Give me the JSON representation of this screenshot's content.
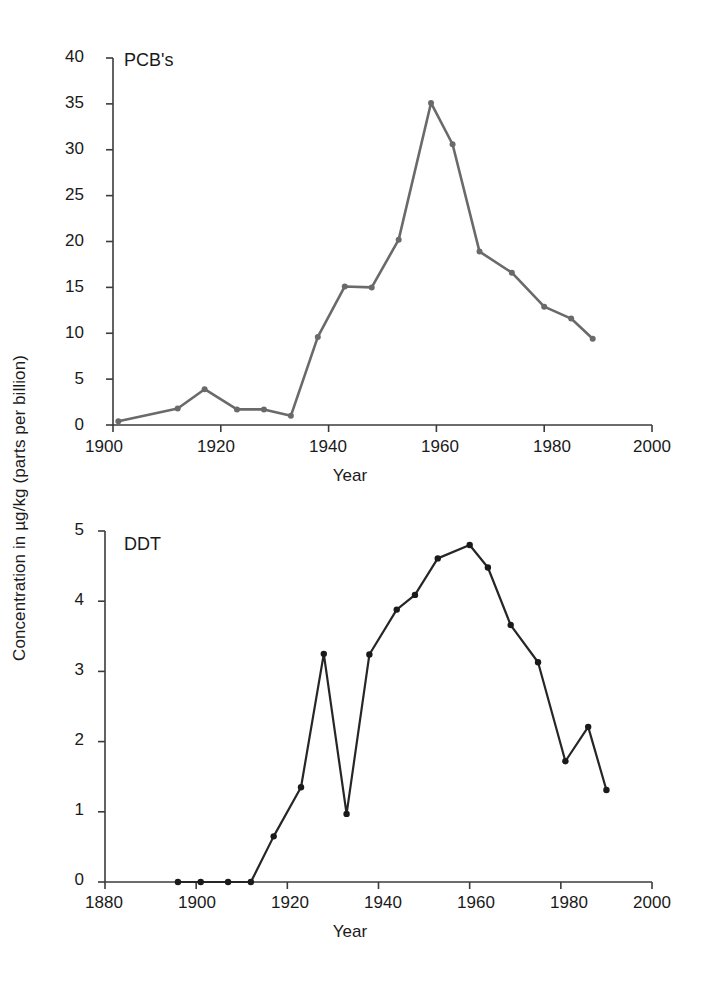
{
  "figure": {
    "y_axis_label": "Concentration in µg/kg (parts per billion)",
    "background_color": "#ffffff"
  },
  "panels": [
    {
      "id": "pcb",
      "title": "PCB's",
      "x_axis_title": "Year",
      "line_color": "#6a6a6a",
      "marker_color": "#6a6a6a",
      "x_ticks": [
        "1900",
        "1920",
        "1940",
        "1960",
        "1980",
        "2000"
      ],
      "y_ticks": [
        "0",
        "5",
        "10",
        "15",
        "20",
        "25",
        "30",
        "35",
        "40"
      ]
    },
    {
      "id": "ddt",
      "title": "DDT",
      "x_axis_title": "Year",
      "line_color": "#262626",
      "marker_color": "#1a1a1a",
      "x_ticks": [
        "1880",
        "1900",
        "1920",
        "1940",
        "1960",
        "1980",
        "2000"
      ],
      "y_ticks": [
        "0",
        "1",
        "2",
        "3",
        "4",
        "5"
      ]
    }
  ],
  "chart_data": [
    {
      "type": "line",
      "title": "PCB's",
      "xlabel": "Year",
      "ylabel": "Concentration in µg/kg (parts per billion)",
      "xlim": [
        1900,
        2000
      ],
      "ylim": [
        0,
        40
      ],
      "xticks": [
        1900,
        1920,
        1940,
        1960,
        1980,
        2000
      ],
      "yticks": [
        0,
        5,
        10,
        15,
        20,
        25,
        30,
        35,
        40
      ],
      "grid": false,
      "legend": "none",
      "marker": "circle",
      "series": [
        {
          "name": "PCB's",
          "x": [
            1901,
            1912,
            1917,
            1923,
            1928,
            1933,
            1938,
            1943,
            1948,
            1953,
            1959,
            1963,
            1968,
            1974,
            1980,
            1985,
            1989
          ],
          "values": [
            0.4,
            1.8,
            3.9,
            1.7,
            1.7,
            1.0,
            9.6,
            15.1,
            15.0,
            20.2,
            35.1,
            30.6,
            18.9,
            16.6,
            12.9,
            11.6,
            9.4
          ]
        }
      ]
    },
    {
      "type": "line",
      "title": "DDT",
      "xlabel": "Year",
      "ylabel": "Concentration in µg/kg (parts per billion)",
      "xlim": [
        1880,
        2000
      ],
      "ylim": [
        0,
        5
      ],
      "xticks": [
        1880,
        1900,
        1920,
        1940,
        1960,
        1980,
        2000
      ],
      "yticks": [
        0,
        1,
        2,
        3,
        4,
        5
      ],
      "grid": false,
      "legend": "none",
      "marker": "circle",
      "series": [
        {
          "name": "DDT",
          "x": [
            1896,
            1901,
            1907,
            1912,
            1917,
            1923,
            1928,
            1933,
            1938,
            1944,
            1948,
            1953,
            1960,
            1964,
            1969,
            1975,
            1981,
            1986,
            1990
          ],
          "values": [
            0.0,
            0.0,
            0.0,
            0.0,
            0.65,
            1.35,
            3.25,
            0.97,
            3.24,
            3.88,
            4.09,
            4.61,
            4.8,
            4.48,
            3.66,
            3.13,
            1.72,
            2.21,
            1.31
          ]
        }
      ]
    }
  ]
}
